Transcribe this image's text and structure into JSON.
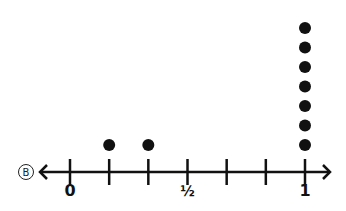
{
  "problem_label": "B",
  "chart_data": {
    "type": "dot_plot",
    "title": "",
    "xlabel": "",
    "ylabel": "",
    "xlim": [
      0,
      1
    ],
    "ticks": [
      0,
      0.1667,
      0.3333,
      0.5,
      0.6667,
      0.8333,
      1
    ],
    "tick_labels": [
      {
        "value": 0,
        "label": "0"
      },
      {
        "value": 0.5,
        "label": "½"
      },
      {
        "value": 1,
        "label": "1"
      }
    ],
    "points": [
      {
        "x": "1/6",
        "value": 0.1667,
        "count": 1
      },
      {
        "x": "2/6",
        "value": 0.3333,
        "count": 1
      },
      {
        "x": "1",
        "value": 1,
        "count": 7
      }
    ],
    "grid": false,
    "legend": null
  }
}
